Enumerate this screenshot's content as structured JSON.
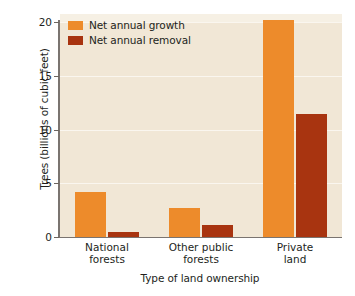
{
  "chart_data": {
    "type": "bar",
    "title": "",
    "subtitle": "",
    "xlabel": "Type of land ownership",
    "ylabel": "Trees (billions of cubic feet)",
    "categories": [
      "National forests",
      "Other public forests",
      "Private land"
    ],
    "category_lines": [
      [
        "National",
        "forests"
      ],
      [
        "Other public",
        "forests"
      ],
      [
        "Private",
        "land"
      ]
    ],
    "series": [
      {
        "name": "Net annual growth",
        "color": "#ed8b2b",
        "values": [
          4.2,
          2.7,
          20.2
        ]
      },
      {
        "name": "Net annual removal",
        "color": "#a83410",
        "values": [
          0.5,
          1.1,
          11.4
        ]
      }
    ],
    "ylim": [
      0,
      20
    ],
    "yticks": [
      0,
      5,
      10,
      15,
      20
    ],
    "ytick_labels": [
      "0",
      "5",
      "10",
      "15",
      "20"
    ],
    "grid": true,
    "grid_axis": "y",
    "legend_position": "top-left-inside",
    "plot_background": "#f1e7d6",
    "figure_background": "#ffffff"
  }
}
